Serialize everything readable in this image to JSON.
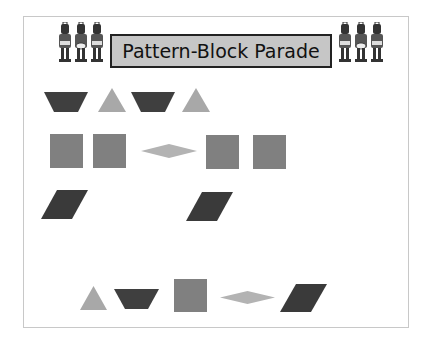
{
  "title": "Pattern-Block Parade",
  "colors": {
    "trapezoid": "#3f3f3f",
    "triangle": "#a8a8a8",
    "square": "#808080",
    "rhombus_thin": "#b3b3b3",
    "parallelogram": "#3a3a3a",
    "frame_border": "#c8c8c8",
    "title_bg": "#c6c6c6"
  },
  "rows": [
    {
      "label": "row-1",
      "pattern": [
        "trapezoid",
        "triangle",
        "trapezoid",
        "triangle"
      ]
    },
    {
      "label": "row-2",
      "pattern": [
        "square",
        "square",
        "thin-rhombus",
        "square",
        "square"
      ]
    },
    {
      "label": "row-3",
      "pattern": [
        "parallelogram",
        "missing",
        "missing",
        "parallelogram"
      ]
    }
  ],
  "answer_choices": [
    "triangle",
    "trapezoid",
    "square",
    "thin-rhombus",
    "parallelogram"
  ],
  "decorations": {
    "left": "toy-soldiers-icon",
    "right": "toy-soldiers-icon"
  }
}
